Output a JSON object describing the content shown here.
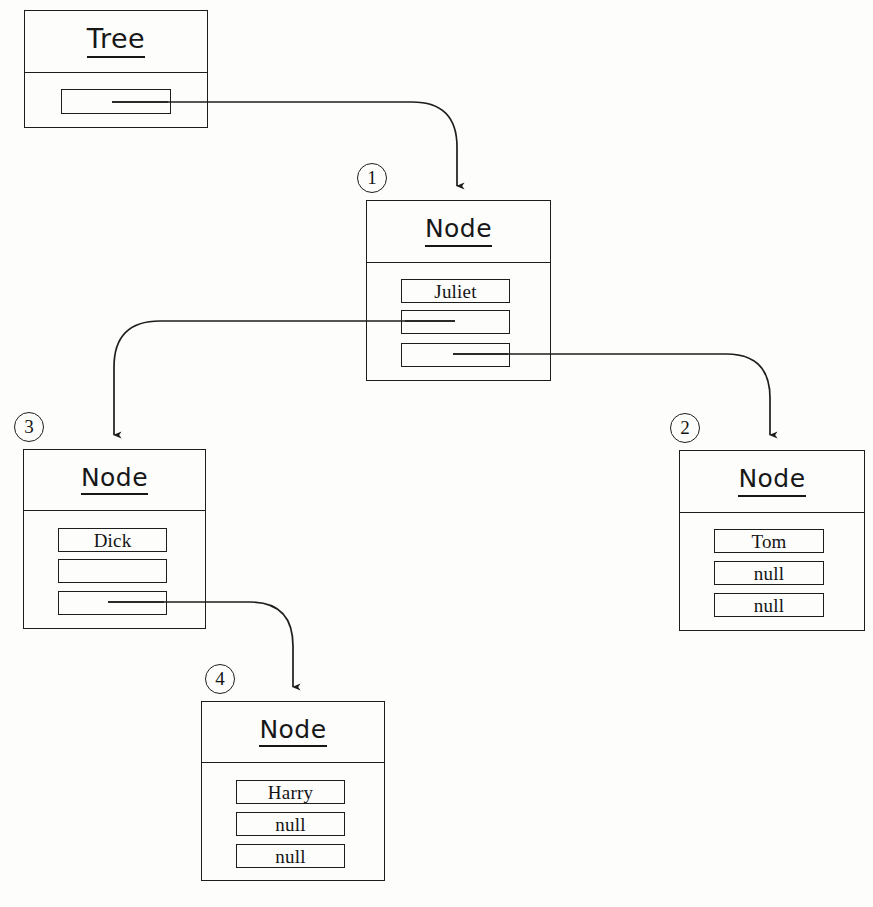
{
  "diagram": {
    "background_color": "#fdfdfc",
    "line_color": "#1d1d1d"
  },
  "tree_object": {
    "ref": "",
    "title": "Tree",
    "fields": [
      {
        "name": "root",
        "value": "",
        "is_pointer": true
      }
    ],
    "box": {
      "x": 24,
      "y": 10,
      "w": 184,
      "h": 118,
      "header_h": 62
    }
  },
  "nodes": [
    {
      "ref": "1",
      "title": "Node",
      "fields": [
        {
          "name": "data",
          "value": "Juliet",
          "is_pointer": false
        },
        {
          "name": "left",
          "value": "",
          "is_pointer": true
        },
        {
          "name": "right",
          "value": "",
          "is_pointer": true
        }
      ],
      "box": {
        "x": 366,
        "y": 200,
        "w": 185,
        "h": 181,
        "header_h": 62
      },
      "ref_pos": {
        "x": 357,
        "y": 163
      }
    },
    {
      "ref": "2",
      "title": "Node",
      "fields": [
        {
          "name": "data",
          "value": "Tom",
          "is_pointer": false
        },
        {
          "name": "left",
          "value": "null",
          "is_pointer": false
        },
        {
          "name": "right",
          "value": "null",
          "is_pointer": false
        }
      ],
      "box": {
        "x": 679,
        "y": 450,
        "w": 186,
        "h": 181,
        "header_h": 62
      },
      "ref_pos": {
        "x": 670,
        "y": 413
      }
    },
    {
      "ref": "3",
      "title": "Node",
      "fields": [
        {
          "name": "data",
          "value": "Dick",
          "is_pointer": false
        },
        {
          "name": "left",
          "value": "",
          "is_pointer": false
        },
        {
          "name": "right",
          "value": "",
          "is_pointer": true
        }
      ],
      "box": {
        "x": 23,
        "y": 449,
        "w": 183,
        "h": 180,
        "header_h": 61
      },
      "ref_pos": {
        "x": 14,
        "y": 412
      }
    },
    {
      "ref": "4",
      "title": "Node",
      "fields": [
        {
          "name": "data",
          "value": "Harry",
          "is_pointer": false
        },
        {
          "name": "left",
          "value": "null",
          "is_pointer": false
        },
        {
          "name": "right",
          "value": "null",
          "is_pointer": false
        }
      ],
      "box": {
        "x": 201,
        "y": 701,
        "w": 184,
        "h": 180,
        "header_h": 61
      },
      "ref_pos": {
        "x": 205,
        "y": 664
      }
    }
  ],
  "connectors": [
    {
      "name": "tree-root-to-node1",
      "from": "Tree.root",
      "to": "Node 1"
    },
    {
      "name": "node1-left-to-node3",
      "from": "Node 1.left",
      "to": "Node 3"
    },
    {
      "name": "node1-right-to-node2",
      "from": "Node 1.right",
      "to": "Node 2"
    },
    {
      "name": "node3-right-to-node4",
      "from": "Node 3.right",
      "to": "Node 4"
    }
  ]
}
